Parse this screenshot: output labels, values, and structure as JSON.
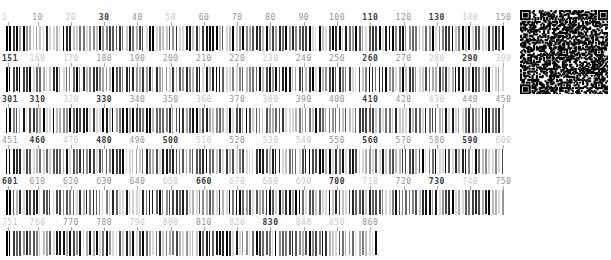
{
  "page": {
    "background": "#ffffff",
    "kind_label": ""
  },
  "colors": {
    "label_dark": "#3c3c3c",
    "label_mid": "#949494",
    "label_light": "#c9c9c9",
    "tick": "#ababab",
    "bar_darkest": "#000000",
    "bar_lightest": "#d9d9d9"
  },
  "qr": {
    "type": "qr-code",
    "approx_modules": 61
  },
  "rows": [
    {
      "range_start": 1,
      "range_end": 150,
      "labels": [
        {
          "text": "1",
          "value": 1,
          "shade": "light",
          "align": "start"
        },
        {
          "text": "10",
          "value": 10,
          "shade": "mid"
        },
        {
          "text": "20",
          "value": 20,
          "shade": "light"
        },
        {
          "text": "30",
          "value": 30,
          "shade": "dark"
        },
        {
          "text": "40",
          "value": 40,
          "shade": "mid"
        },
        {
          "text": "50",
          "value": 50,
          "shade": "light"
        },
        {
          "text": "60",
          "value": 60,
          "shade": "mid"
        },
        {
          "text": "70",
          "value": 70,
          "shade": "mid"
        },
        {
          "text": "80",
          "value": 80,
          "shade": "mid"
        },
        {
          "text": "90",
          "value": 90,
          "shade": "mid"
        },
        {
          "text": "100",
          "value": 100,
          "shade": "mid"
        },
        {
          "text": "110",
          "value": 110,
          "shade": "dark"
        },
        {
          "text": "120",
          "value": 120,
          "shade": "mid"
        },
        {
          "text": "130",
          "value": 130,
          "shade": "dark"
        },
        {
          "text": "140",
          "value": 140,
          "shade": "light"
        },
        {
          "text": "150",
          "value": 150,
          "shade": "mid"
        }
      ]
    },
    {
      "range_start": 151,
      "range_end": 300,
      "labels": [
        {
          "text": "151",
          "value": 151,
          "shade": "dark",
          "align": "start"
        },
        {
          "text": "160",
          "value": 160,
          "shade": "light"
        },
        {
          "text": "170",
          "value": 170,
          "shade": "light"
        },
        {
          "text": "180",
          "value": 180,
          "shade": "mid"
        },
        {
          "text": "190",
          "value": 190,
          "shade": "mid"
        },
        {
          "text": "200",
          "value": 200,
          "shade": "mid"
        },
        {
          "text": "210",
          "value": 210,
          "shade": "mid"
        },
        {
          "text": "220",
          "value": 220,
          "shade": "mid"
        },
        {
          "text": "230",
          "value": 230,
          "shade": "light"
        },
        {
          "text": "240",
          "value": 240,
          "shade": "mid"
        },
        {
          "text": "250",
          "value": 250,
          "shade": "mid"
        },
        {
          "text": "260",
          "value": 260,
          "shade": "dark"
        },
        {
          "text": "270",
          "value": 270,
          "shade": "mid"
        },
        {
          "text": "280",
          "value": 280,
          "shade": "light"
        },
        {
          "text": "290",
          "value": 290,
          "shade": "dark"
        },
        {
          "text": "300",
          "value": 300,
          "shade": "light"
        }
      ]
    },
    {
      "range_start": 301,
      "range_end": 450,
      "labels": [
        {
          "text": "301",
          "value": 301,
          "shade": "dark",
          "align": "start"
        },
        {
          "text": "310",
          "value": 310,
          "shade": "dark"
        },
        {
          "text": "320",
          "value": 320,
          "shade": "light"
        },
        {
          "text": "330",
          "value": 330,
          "shade": "dark"
        },
        {
          "text": "340",
          "value": 340,
          "shade": "mid"
        },
        {
          "text": "350",
          "value": 350,
          "shade": "mid"
        },
        {
          "text": "360",
          "value": 360,
          "shade": "light"
        },
        {
          "text": "370",
          "value": 370,
          "shade": "mid"
        },
        {
          "text": "380",
          "value": 380,
          "shade": "light"
        },
        {
          "text": "390",
          "value": 390,
          "shade": "mid"
        },
        {
          "text": "400",
          "value": 400,
          "shade": "mid"
        },
        {
          "text": "410",
          "value": 410,
          "shade": "dark"
        },
        {
          "text": "420",
          "value": 420,
          "shade": "mid"
        },
        {
          "text": "430",
          "value": 430,
          "shade": "light"
        },
        {
          "text": "440",
          "value": 440,
          "shade": "mid"
        },
        {
          "text": "450",
          "value": 450,
          "shade": "mid"
        }
      ]
    },
    {
      "range_start": 451,
      "range_end": 600,
      "labels": [
        {
          "text": "451",
          "value": 451,
          "shade": "mid",
          "align": "start"
        },
        {
          "text": "460",
          "value": 460,
          "shade": "dark"
        },
        {
          "text": "470",
          "value": 470,
          "shade": "light"
        },
        {
          "text": "480",
          "value": 480,
          "shade": "dark"
        },
        {
          "text": "490",
          "value": 490,
          "shade": "mid"
        },
        {
          "text": "500",
          "value": 500,
          "shade": "dark"
        },
        {
          "text": "510",
          "value": 510,
          "shade": "light"
        },
        {
          "text": "520",
          "value": 520,
          "shade": "mid"
        },
        {
          "text": "530",
          "value": 530,
          "shade": "light"
        },
        {
          "text": "540",
          "value": 540,
          "shade": "light"
        },
        {
          "text": "550",
          "value": 550,
          "shade": "mid"
        },
        {
          "text": "560",
          "value": 560,
          "shade": "dark"
        },
        {
          "text": "570",
          "value": 570,
          "shade": "mid"
        },
        {
          "text": "580",
          "value": 580,
          "shade": "mid"
        },
        {
          "text": "590",
          "value": 590,
          "shade": "dark"
        },
        {
          "text": "600",
          "value": 600,
          "shade": "light"
        }
      ]
    },
    {
      "range_start": 601,
      "range_end": 750,
      "labels": [
        {
          "text": "601",
          "value": 601,
          "shade": "dark",
          "align": "start"
        },
        {
          "text": "610",
          "value": 610,
          "shade": "mid"
        },
        {
          "text": "620",
          "value": 620,
          "shade": "mid"
        },
        {
          "text": "630",
          "value": 630,
          "shade": "mid"
        },
        {
          "text": "640",
          "value": 640,
          "shade": "mid"
        },
        {
          "text": "650",
          "value": 650,
          "shade": "light"
        },
        {
          "text": "660",
          "value": 660,
          "shade": "dark"
        },
        {
          "text": "670",
          "value": 670,
          "shade": "light"
        },
        {
          "text": "680",
          "value": 680,
          "shade": "light"
        },
        {
          "text": "690",
          "value": 690,
          "shade": "light"
        },
        {
          "text": "700",
          "value": 700,
          "shade": "dark"
        },
        {
          "text": "710",
          "value": 710,
          "shade": "light"
        },
        {
          "text": "720",
          "value": 720,
          "shade": "mid"
        },
        {
          "text": "730",
          "value": 730,
          "shade": "dark"
        },
        {
          "text": "740",
          "value": 740,
          "shade": "light"
        },
        {
          "text": "750",
          "value": 750,
          "shade": "mid"
        }
      ]
    },
    {
      "range_start": 751,
      "range_end": 862,
      "labels": [
        {
          "text": "751",
          "value": 751,
          "shade": "light",
          "align": "start"
        },
        {
          "text": "760",
          "value": 760,
          "shade": "light"
        },
        {
          "text": "770",
          "value": 770,
          "shade": "mid"
        },
        {
          "text": "780",
          "value": 780,
          "shade": "mid"
        },
        {
          "text": "790",
          "value": 790,
          "shade": "light"
        },
        {
          "text": "800",
          "value": 800,
          "shade": "light"
        },
        {
          "text": "810",
          "value": 810,
          "shade": "mid"
        },
        {
          "text": "820",
          "value": 820,
          "shade": "light"
        },
        {
          "text": "830",
          "value": 830,
          "shade": "dark"
        },
        {
          "text": "840",
          "value": 840,
          "shade": "light"
        },
        {
          "text": "850",
          "value": 850,
          "shade": "light"
        },
        {
          "text": "860",
          "value": 860,
          "shade": "mid"
        }
      ]
    }
  ]
}
